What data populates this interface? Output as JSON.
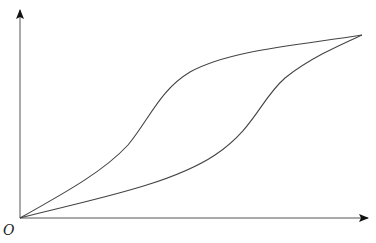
{
  "diagram": {
    "origin_label": "O",
    "axes": {
      "origin": [
        20,
        218
      ],
      "x_axis_end": [
        368,
        218
      ],
      "y_axis_end": [
        20,
        10
      ]
    },
    "curves": [
      {
        "name": "upper-curve",
        "path": "M20,218 C70,190 105,170 128,145 C150,118 160,90 190,72 C230,50 300,45 362,35"
      },
      {
        "name": "lower-curve",
        "path": "M20,218 C90,200 170,185 215,155 C255,128 260,100 285,78 C310,58 340,45 362,35"
      }
    ],
    "stroke_color": "#444444"
  }
}
